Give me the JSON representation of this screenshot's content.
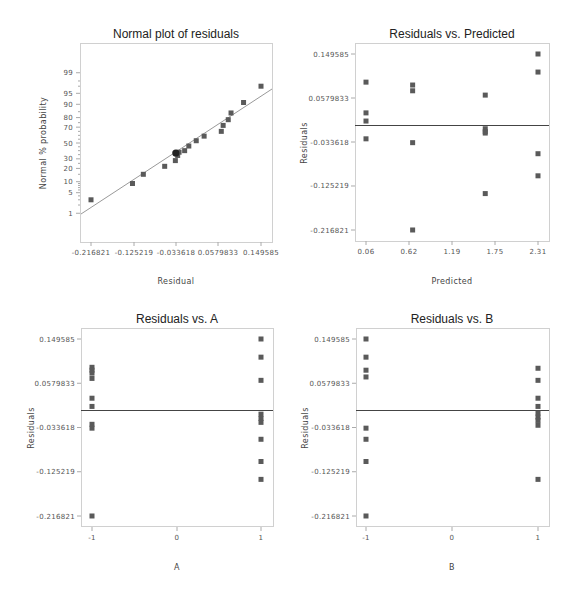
{
  "chart_data": [
    {
      "id": "normal",
      "type": "scatter",
      "title": "Normal plot of residuals",
      "xlabel": "Residual",
      "ylabel": "Normal % probability",
      "xticks": [
        "-0.216821",
        "-0.125219",
        "-0.033618",
        "0.0579833",
        "0.149585"
      ],
      "yticks": [
        "99",
        "95",
        "90",
        "80",
        "70",
        "50",
        "30",
        "20",
        "10",
        "5",
        "1"
      ],
      "xlim": [
        -0.24,
        0.177
      ],
      "grid": false,
      "fit_line": true,
      "points": [
        {
          "x": -0.2168,
          "p": 3
        },
        {
          "x": -0.1274,
          "p": 9
        },
        {
          "x": -0.104,
          "p": 15
        },
        {
          "x": -0.058,
          "p": 22
        },
        {
          "x": -0.035,
          "p": 28
        },
        {
          "x": -0.03,
          "p": 34
        },
        {
          "x": -0.027,
          "p": 38
        },
        {
          "x": -0.015,
          "p": 40
        },
        {
          "x": -0.006,
          "p": 46
        },
        {
          "x": 0.01,
          "p": 53
        },
        {
          "x": 0.027,
          "p": 59
        },
        {
          "x": 0.064,
          "p": 65
        },
        {
          "x": 0.068,
          "p": 72
        },
        {
          "x": 0.079,
          "p": 78
        },
        {
          "x": 0.085,
          "p": 84
        },
        {
          "x": 0.112,
          "p": 91
        },
        {
          "x": 0.1496,
          "p": 97
        }
      ],
      "highlighted_point": {
        "x": -0.034,
        "p": 37
      }
    },
    {
      "id": "predicted",
      "type": "scatter",
      "title": "Residuals vs. Predicted",
      "xlabel": "Predicted",
      "ylabel": "Residuals",
      "xticks": [
        "0.06",
        "0.62",
        "1.19",
        "1.75",
        "2.31"
      ],
      "yticks": [
        "0.149585",
        "0.0579833",
        "-0.033618",
        "-0.125219",
        "-0.216821"
      ],
      "reference_line_y": 0,
      "points": [
        {
          "x": 0.06,
          "y": 0.091
        },
        {
          "x": 0.06,
          "y": 0.027
        },
        {
          "x": 0.06,
          "y": 0.01
        },
        {
          "x": 0.06,
          "y": -0.027
        },
        {
          "x": 0.67,
          "y": 0.085
        },
        {
          "x": 0.67,
          "y": 0.073
        },
        {
          "x": 0.67,
          "y": -0.035
        },
        {
          "x": 0.67,
          "y": -0.2168
        },
        {
          "x": 1.62,
          "y": 0.064
        },
        {
          "x": 1.62,
          "y": -0.006
        },
        {
          "x": 1.62,
          "y": -0.012
        },
        {
          "x": 1.62,
          "y": -0.015
        },
        {
          "x": 1.62,
          "y": -0.141
        },
        {
          "x": 2.31,
          "y": 0.1496
        },
        {
          "x": 2.31,
          "y": 0.112
        },
        {
          "x": 2.31,
          "y": -0.058
        },
        {
          "x": 2.31,
          "y": -0.104
        }
      ]
    },
    {
      "id": "vsA",
      "type": "scatter",
      "title": "Residuals vs. A",
      "xlabel": "A",
      "ylabel": "Residuals",
      "xticks": [
        "-1",
        "0",
        "1"
      ],
      "yticks": [
        "0.149585",
        "0.0579833",
        "-0.033618",
        "-0.125219",
        "-0.216821"
      ],
      "reference_line_y": 0,
      "points": [
        {
          "x": -1,
          "y": 0.091
        },
        {
          "x": -1,
          "y": 0.085
        },
        {
          "x": -1,
          "y": 0.079
        },
        {
          "x": -1,
          "y": 0.068
        },
        {
          "x": -1,
          "y": 0.027
        },
        {
          "x": -1,
          "y": 0.01
        },
        {
          "x": -1,
          "y": -0.027
        },
        {
          "x": -1,
          "y": -0.035
        },
        {
          "x": -1,
          "y": -0.2168
        },
        {
          "x": 1,
          "y": 0.1496
        },
        {
          "x": 1,
          "y": 0.112
        },
        {
          "x": 1,
          "y": 0.064
        },
        {
          "x": 1,
          "y": -0.006
        },
        {
          "x": 1,
          "y": -0.015
        },
        {
          "x": 1,
          "y": -0.023
        },
        {
          "x": 1,
          "y": -0.058
        },
        {
          "x": 1,
          "y": -0.104
        },
        {
          "x": 1,
          "y": -0.141
        }
      ]
    },
    {
      "id": "vsB",
      "type": "scatter",
      "title": "Residuals vs. B",
      "xlabel": "B",
      "ylabel": "Residuals",
      "xticks": [
        "-1",
        "0",
        "1"
      ],
      "yticks": [
        "0.149585",
        "0.0579833",
        "-0.033618",
        "-0.125219",
        "-0.216821"
      ],
      "reference_line_y": 0,
      "points": [
        {
          "x": -1,
          "y": 0.1496
        },
        {
          "x": -1,
          "y": 0.112
        },
        {
          "x": -1,
          "y": 0.085
        },
        {
          "x": -1,
          "y": 0.071
        },
        {
          "x": -1,
          "y": -0.035
        },
        {
          "x": -1,
          "y": -0.058
        },
        {
          "x": -1,
          "y": -0.104
        },
        {
          "x": -1,
          "y": -0.2168
        },
        {
          "x": 1,
          "y": 0.089
        },
        {
          "x": 1,
          "y": 0.064
        },
        {
          "x": 1,
          "y": 0.027
        },
        {
          "x": 1,
          "y": 0.01
        },
        {
          "x": 1,
          "y": -0.004
        },
        {
          "x": 1,
          "y": -0.012
        },
        {
          "x": 1,
          "y": -0.019
        },
        {
          "x": 1,
          "y": -0.029
        },
        {
          "x": 1,
          "y": -0.141
        }
      ]
    }
  ],
  "colors": {
    "point": "#5a5a5a",
    "frame": "#d0d0d0",
    "reference_line": "#444444",
    "fit_line": "#999999"
  }
}
